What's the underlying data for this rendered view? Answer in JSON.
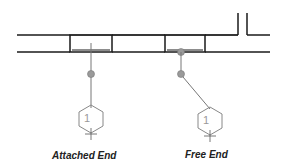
{
  "diagram": {
    "labels": {
      "attached": "Attached End",
      "free": "Free End"
    },
    "tags": {
      "attached_number": "1",
      "free_number": "1"
    },
    "colors": {
      "wall_line": "#1a1a1a",
      "leader": "#777777",
      "dot_fill": "#9a9a9a",
      "hexagon": "#888888",
      "tag_text": "#999999"
    }
  }
}
